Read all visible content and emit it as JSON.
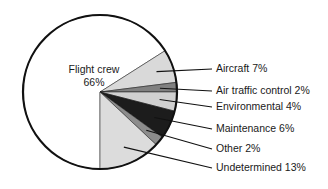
{
  "chart_data": {
    "type": "pie",
    "title": "",
    "legend_position": "right",
    "center_label": {
      "line1": "Flight crew",
      "line2": "66%"
    },
    "categories": [
      "Flight crew",
      "Aircraft",
      "Air traffic control",
      "Environmental",
      "Maintenance",
      "Other",
      "Undetermined"
    ],
    "values": [
      66,
      7,
      2,
      4,
      6,
      2,
      13
    ],
    "units": "%",
    "slices": [
      {
        "label": "Flight crew",
        "value": 66,
        "display": "Flight crew 66%",
        "color": "#ffffff",
        "placement": "inside"
      },
      {
        "label": "Aircraft",
        "value": 7,
        "display": "Aircraft 7%",
        "color": "#d9d9d9",
        "placement": "leader"
      },
      {
        "label": "Air traffic control",
        "value": 2,
        "display": "Air traffic control 2%",
        "color": "#808080",
        "placement": "leader"
      },
      {
        "label": "Environmental",
        "value": 4,
        "display": "Environmental 4%",
        "color": "#d0d0d0",
        "placement": "leader"
      },
      {
        "label": "Maintenance",
        "value": 6,
        "display": "Maintenance 6%",
        "color": "#1c1c1c",
        "placement": "leader"
      },
      {
        "label": "Other",
        "value": 2,
        "display": "Other 2%",
        "color": "#8c8c8c",
        "placement": "leader"
      },
      {
        "label": "Undetermined",
        "value": 13,
        "display": "Undetermined 13%",
        "color": "#dcdcdc",
        "placement": "leader"
      }
    ],
    "legend_entries": [
      "Aircraft 7%",
      "Air traffic control 2%",
      "Environmental 4%",
      "Maintenance 6%",
      "Other 2%",
      "Undetermined 13%"
    ],
    "outline_color": "#111111",
    "background_color": "#ffffff"
  }
}
